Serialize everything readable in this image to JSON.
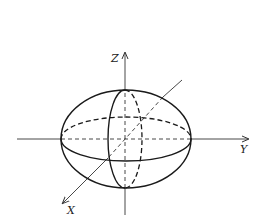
{
  "diagram": {
    "type": "3d-ellipsoid",
    "axes": {
      "z": {
        "label": "Z"
      },
      "y": {
        "label": "Y"
      },
      "x": {
        "label": "X"
      }
    },
    "colors": {
      "stroke": "#1a1a1a",
      "background": "#ffffff"
    }
  }
}
